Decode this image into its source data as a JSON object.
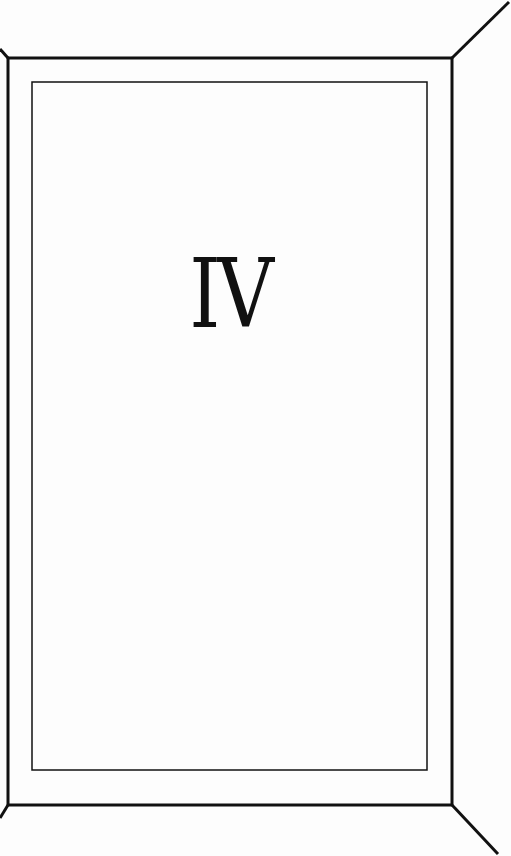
{
  "diagram": {
    "label": "IV",
    "colors": {
      "stroke": "#111111",
      "background": "#fdfdfd",
      "text": "#111111"
    },
    "outer_frame": {
      "x1": 8,
      "y1": 58,
      "x2": 452,
      "y2": 805,
      "stroke_width": 3
    },
    "inner_frame": {
      "x1": 32,
      "y1": 82,
      "x2": 427,
      "y2": 770,
      "stroke_width": 1.5
    },
    "diagonals": [
      {
        "name": "top-right",
        "from": [
          452,
          58
        ],
        "to": [
          509,
          2
        ]
      },
      {
        "name": "bottom-right",
        "from": [
          452,
          805
        ],
        "to": [
          498,
          854
        ]
      },
      {
        "name": "top-left",
        "from": [
          8,
          58
        ],
        "to": [
          0,
          50
        ]
      },
      {
        "name": "bottom-left",
        "from": [
          8,
          805
        ],
        "to": [
          0,
          818
        ]
      }
    ]
  }
}
